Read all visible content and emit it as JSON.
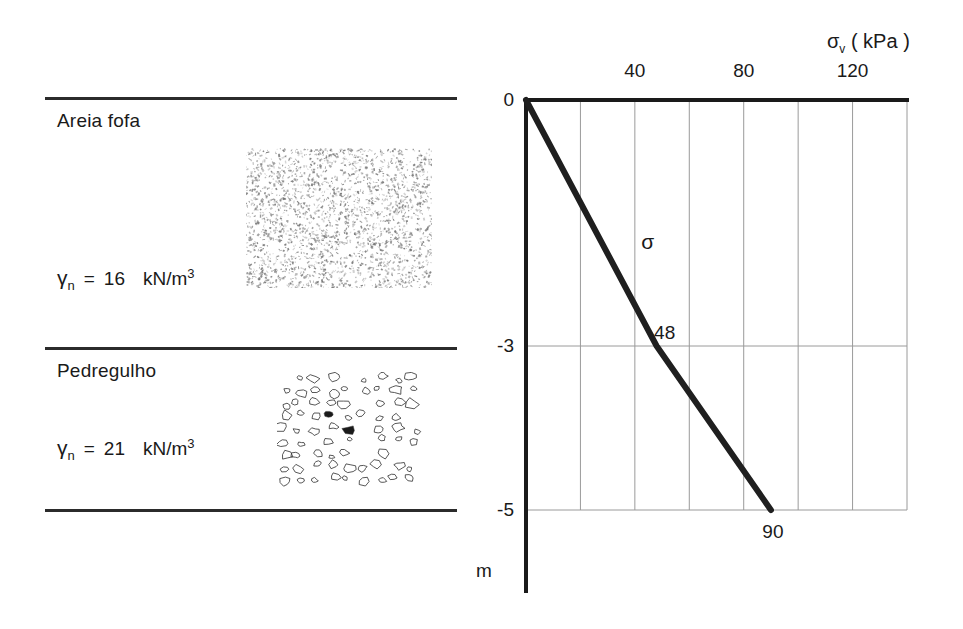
{
  "figure": {
    "kind": "soil-profile-with-vertical-stress-diagram"
  },
  "soil_profile": {
    "layers": [
      {
        "id": "layer-1",
        "name": "Areia fofa",
        "unit_weight_symbol": "γ",
        "unit_weight_subscript": "n",
        "equals": "=",
        "unit_weight_value": "16",
        "unit_weight_unit": "kN/m",
        "unit_weight_unit_exponent": "3",
        "texture": "sand-stipple",
        "depth_from_m": 0,
        "depth_to_m": -3
      },
      {
        "id": "layer-2",
        "name": "Pedregulho",
        "unit_weight_symbol": "γ",
        "unit_weight_subscript": "n",
        "equals": "=",
        "unit_weight_value": "21",
        "unit_weight_unit": "kN/m",
        "unit_weight_unit_exponent": "3",
        "texture": "gravel-pebbles",
        "depth_from_m": -3,
        "depth_to_m": -5
      }
    ]
  },
  "chart_data": {
    "type": "line",
    "title": "",
    "xlabel": "σv ( kPa )",
    "xlabel_symbol": "σ",
    "xlabel_subscript": "v",
    "xlabel_unit": "( kPa )",
    "ylabel": "m",
    "xlim": [
      0,
      140
    ],
    "ylim": [
      -5,
      0
    ],
    "x_axis_position": "top",
    "grid": true,
    "xticks": [
      0,
      20,
      40,
      60,
      80,
      100,
      120,
      140
    ],
    "xtick_labels": [
      "",
      "",
      "40",
      "",
      "80",
      "",
      "120",
      ""
    ],
    "yticks": [
      0,
      -3,
      -5
    ],
    "ytick_labels": [
      "0",
      "-3",
      "-5"
    ],
    "series": [
      {
        "name": "σ",
        "x": [
          0,
          48,
          90
        ],
        "y": [
          0,
          -3,
          -5
        ]
      }
    ],
    "annotations": [
      {
        "id": "series-label",
        "text": "σ",
        "x": 46,
        "y": -1.75
      },
      {
        "id": "breakpoint-value",
        "text": "48",
        "x": 50,
        "y": -2.85
      },
      {
        "id": "endpoint-value",
        "text": "90",
        "x": 92,
        "y": -5.25
      }
    ],
    "legend": null,
    "colors": {
      "curve": "#1f1f1f",
      "axis": "#1a1a1a",
      "grid": "#9a9a9a",
      "background": "#ffffff"
    }
  }
}
